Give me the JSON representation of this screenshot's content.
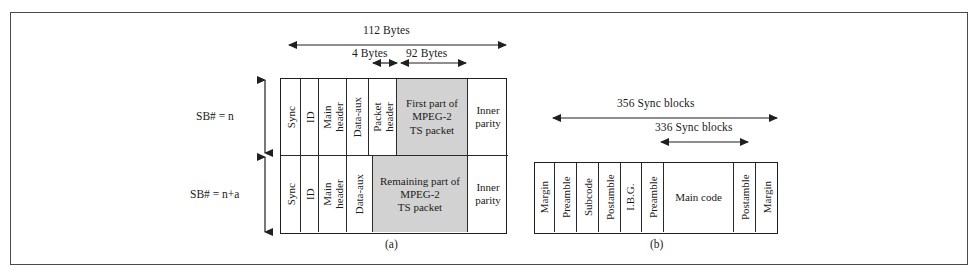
{
  "figure": {
    "caption_a": "(a)",
    "caption_b": "(b)"
  },
  "panel_a": {
    "dimensions": [
      {
        "name": "total",
        "label": "112 Bytes"
      },
      {
        "name": "packet-header",
        "label": "4 Bytes"
      },
      {
        "name": "ts-payload",
        "label": "92 Bytes"
      }
    ],
    "row_labels": [
      {
        "label": "SB# = n"
      },
      {
        "label": "SB# = n+a"
      }
    ],
    "row_top": {
      "cells": [
        {
          "label": "Sync",
          "orient": "vertical",
          "gray": false
        },
        {
          "label": "ID",
          "orient": "vertical",
          "gray": false
        },
        {
          "label": "Main\nheader",
          "orient": "vertical",
          "gray": false
        },
        {
          "label": "Data-aux",
          "orient": "vertical",
          "gray": false
        },
        {
          "label": "Packet\nheader",
          "orient": "vertical",
          "gray": false
        },
        {
          "label": "First part of\nMPEG-2\nTS packet",
          "orient": "horizontal",
          "gray": true
        },
        {
          "label": "Inner\nparity",
          "orient": "horizontal",
          "gray": false
        }
      ]
    },
    "row_bottom": {
      "cells": [
        {
          "label": "Sync",
          "orient": "vertical",
          "gray": false
        },
        {
          "label": "ID",
          "orient": "vertical",
          "gray": false
        },
        {
          "label": "Main\nheader",
          "orient": "vertical",
          "gray": false
        },
        {
          "label": "Data-aux",
          "orient": "vertical",
          "gray": false
        },
        {
          "label": "Remaining part of\nMPEG-2\nTS packet",
          "orient": "horizontal",
          "gray": true
        },
        {
          "label": "Inner\nparity",
          "orient": "horizontal",
          "gray": false
        }
      ]
    }
  },
  "panel_b": {
    "dimensions": [
      {
        "name": "total-sync-blocks",
        "label": "356 Sync blocks"
      },
      {
        "name": "main-sync-blocks",
        "label": "336 Sync blocks"
      }
    ],
    "cells": [
      {
        "label": "Margin",
        "orient": "vertical"
      },
      {
        "label": "Preamble",
        "orient": "vertical"
      },
      {
        "label": "Subcode",
        "orient": "vertical"
      },
      {
        "label": "Postamble",
        "orient": "vertical"
      },
      {
        "label": "I.B.G.",
        "orient": "vertical"
      },
      {
        "label": "Preamble",
        "orient": "vertical"
      },
      {
        "label": "Main code",
        "orient": "horizontal"
      },
      {
        "label": "Postamble",
        "orient": "vertical"
      },
      {
        "label": "Margin",
        "orient": "vertical"
      }
    ]
  },
  "colors": {
    "gray_fill": "#d2d2d2",
    "line": "#1f1f1f",
    "frame": "#4a4a4a"
  }
}
